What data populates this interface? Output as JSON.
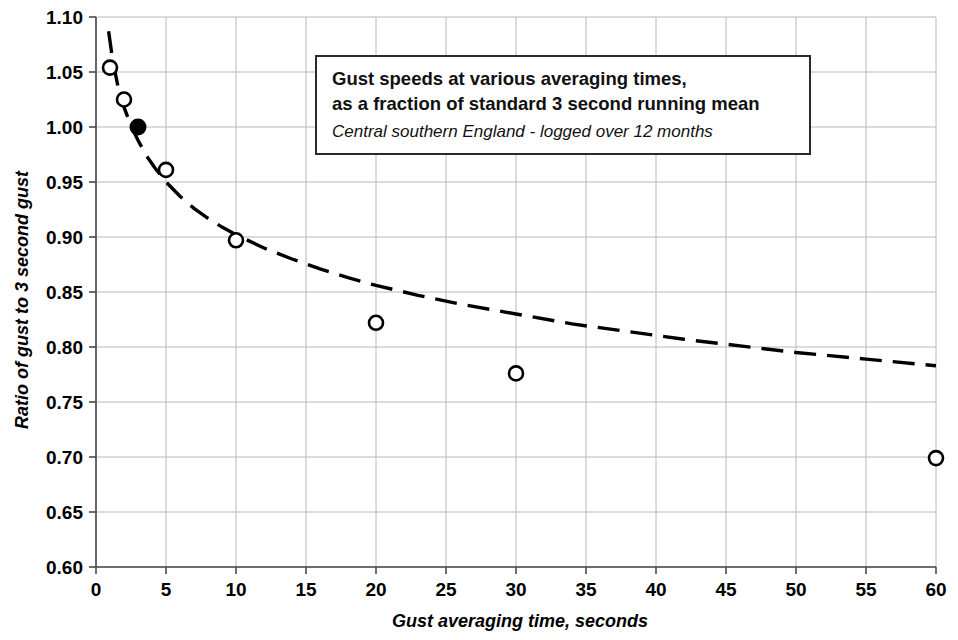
{
  "chart_data": {
    "type": "scatter",
    "title": "Gust speeds at various averaging times, as a fraction of standard 3 second running mean",
    "title_lines": [
      "Gust speeds at various averaging times,",
      "as a fraction of standard 3 second running mean"
    ],
    "subtitle": "Central southern England - logged over 12 months",
    "xlabel": "Gust averaging time, seconds",
    "ylabel": "Ratio of gust to 3 second gust",
    "xlim": [
      0,
      60
    ],
    "ylim": [
      0.6,
      1.1
    ],
    "xticks": [
      0,
      5,
      10,
      15,
      20,
      25,
      30,
      35,
      40,
      45,
      50,
      55,
      60
    ],
    "yticks": [
      0.6,
      0.65,
      0.7,
      0.75,
      0.8,
      0.85,
      0.9,
      0.95,
      1.0,
      1.05,
      1.1
    ],
    "xtick_labels": [
      "0",
      "5",
      "10",
      "15",
      "20",
      "25",
      "30",
      "35",
      "40",
      "45",
      "50",
      "55",
      "60"
    ],
    "ytick_labels": [
      "0.60",
      "0.65",
      "0.70",
      "0.75",
      "0.80",
      "0.85",
      "0.90",
      "0.95",
      "1.00",
      "1.05",
      "1.10"
    ],
    "grid": true,
    "legend": "none",
    "series": [
      {
        "name": "Measured gust ratio",
        "marker": "open-circle",
        "x": [
          1,
          2,
          5,
          10,
          20,
          30,
          60
        ],
        "values": [
          1.054,
          1.025,
          0.961,
          0.897,
          0.822,
          0.776,
          0.699
        ]
      },
      {
        "name": "Reference 3 second gust",
        "marker": "filled-circle",
        "x": [
          3
        ],
        "values": [
          1.0
        ]
      },
      {
        "name": "Fitted trend curve",
        "marker": "dashed-line",
        "x": [
          0.9,
          1.2,
          1.6,
          2.0,
          2.5,
          3.0,
          3.6,
          4.2,
          5.0,
          6.0,
          7.0,
          8.0,
          9.0,
          10.0,
          12.0,
          14.0,
          16.0,
          18.0,
          20.0,
          23.0,
          26.0,
          30.0,
          34.0,
          38.0,
          42.0,
          46.0,
          50.0,
          55.0,
          60.0
        ],
        "values": [
          1.087,
          1.06,
          1.035,
          1.018,
          1.001,
          0.988,
          0.974,
          0.963,
          0.95,
          0.937,
          0.926,
          0.917,
          0.909,
          0.902,
          0.89,
          0.88,
          0.871,
          0.863,
          0.856,
          0.847,
          0.839,
          0.83,
          0.821,
          0.814,
          0.807,
          0.801,
          0.795,
          0.789,
          0.783
        ]
      }
    ]
  },
  "colors": {
    "ink": "#000000",
    "grid": "#b8b8b8",
    "axis": "#4a4a4a",
    "box_border": "#2a2a2a",
    "background": "#ffffff"
  }
}
